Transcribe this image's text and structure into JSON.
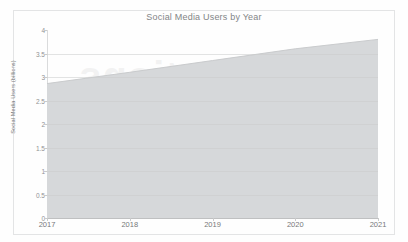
{
  "figure": {
    "background_color": "#fefefe",
    "frame_color": "#e2e3e4",
    "watermark_text": "Applications",
    "watermark_text_2": "on"
  },
  "chart_data": {
    "type": "area",
    "title": "Social Media Users by Year",
    "xlabel": "",
    "ylabel": "Social Media Users (billions)",
    "categories": [
      "2017",
      "2018",
      "2019",
      "2020",
      "2021"
    ],
    "x": [
      2017,
      2018,
      2019,
      2020,
      2021
    ],
    "values": [
      2.86,
      3.1,
      3.35,
      3.6,
      3.8
    ],
    "series": [
      {
        "name": "Social Media Users",
        "values": [
          2.86,
          3.1,
          3.35,
          3.6,
          3.8
        ]
      }
    ],
    "ylim": [
      0,
      4
    ],
    "xlim": [
      2017,
      2021
    ],
    "yticks": [
      0,
      0.5,
      1,
      1.5,
      2,
      2.5,
      3,
      3.5,
      4
    ],
    "ytick_labels": [
      "0",
      "0.5",
      "1",
      "1.5",
      "2",
      "2.5",
      "3",
      "3.5",
      "4"
    ],
    "xticks": [
      2017,
      2018,
      2019,
      2020,
      2021
    ],
    "xtick_labels": [
      "2017",
      "2018",
      "2019",
      "2020",
      "2021"
    ],
    "grid": true,
    "legend": false,
    "legend_position": "none",
    "fill_color": "#d4d6d8",
    "line_color": "#c6c8ca"
  }
}
